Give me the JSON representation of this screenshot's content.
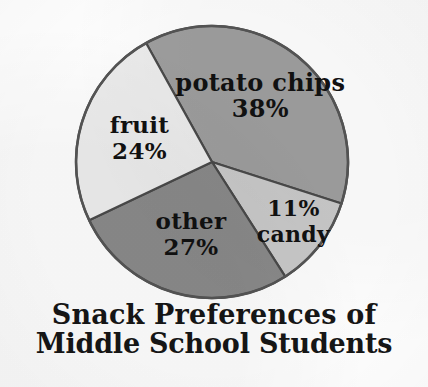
{
  "chart_data": {
    "type": "pie",
    "title": "Snack Preferences of Middle School Students",
    "title_lines": [
      "Snack Preferences of",
      "Middle School Students"
    ],
    "xlabel": "",
    "ylabel": "",
    "legend_position": "none",
    "grid": false,
    "units": "percent",
    "categories": [
      "potato chips",
      "candy",
      "other",
      "fruit"
    ],
    "values": [
      38,
      11,
      27,
      24
    ],
    "slices": [
      {
        "label": "potato chips",
        "value": 38,
        "value_text": "38%",
        "color": "#9e9e9e",
        "label_line_1": "potato chips",
        "label_line_2": "38%",
        "label_order": "name_then_value"
      },
      {
        "label": "candy",
        "value": 11,
        "value_text": "11%",
        "color": "#c9c9c9",
        "label_line_1": "11%",
        "label_line_2": "candy",
        "label_order": "value_then_name"
      },
      {
        "label": "other",
        "value": 27,
        "value_text": "27%",
        "color": "#8a8a8a",
        "label_line_1": "other",
        "label_line_2": "27%",
        "label_order": "name_then_value"
      },
      {
        "label": "fruit",
        "value": 24,
        "value_text": "24%",
        "color": "#ececec",
        "label_line_1": "fruit",
        "label_line_2": "24%",
        "label_order": "name_then_value"
      }
    ]
  },
  "colors": {
    "background": "#fdfdfd",
    "outline": "#555555",
    "slice_divider": "#4a4a4a",
    "text": "#161616",
    "potato_chips": "#9e9e9e",
    "candy": "#c9c9c9",
    "other": "#8a8a8a",
    "fruit": "#ececec"
  }
}
